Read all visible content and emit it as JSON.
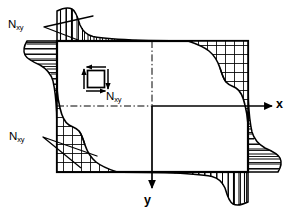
{
  "figure": {
    "type": "engineering-diagram",
    "background_color": "#ffffff",
    "line_color": "#000000",
    "width": 291,
    "height": 215
  },
  "labels": {
    "shear_symbol": "N",
    "shear_subscript": "xy",
    "axis_x": "x",
    "axis_y": "y",
    "callout_top_left": {
      "symbol": "N",
      "subscript": "xy"
    },
    "callout_bottom_left": {
      "symbol": "N",
      "subscript": "xy"
    },
    "callout_center": {
      "symbol": "N",
      "subscript": "xy"
    }
  },
  "plate": {
    "left": 57,
    "top": 41,
    "right": 248,
    "bottom": 172,
    "stroke_width": 2.2,
    "fill": "#ffffff"
  },
  "axes": {
    "origin_x": 152,
    "origin_y": 106,
    "x_axis": {
      "from_x": 57,
      "to_x": 272,
      "y": 106,
      "arrow": "right",
      "label": "x"
    },
    "y_axis": {
      "x": 152,
      "from_y": 41,
      "to_y": 188,
      "arrow": "down",
      "label": "y"
    },
    "centerline_style": "dash-dot"
  },
  "shear_element": {
    "center_x": 96,
    "center_y": 79,
    "size": 17,
    "arrows": [
      {
        "edge": "top",
        "direction": "left"
      },
      {
        "edge": "bottom",
        "direction": "right"
      },
      {
        "edge": "left",
        "direction": "up"
      },
      {
        "edge": "right",
        "direction": "down"
      }
    ]
  },
  "distributions": [
    {
      "name": "top-edge-external",
      "edge": "top",
      "side": "outside",
      "hatch": "vertical",
      "peak_at": "left",
      "decay": "toward-right"
    },
    {
      "name": "left-edge-external",
      "edge": "left",
      "side": "outside",
      "hatch": "horizontal",
      "peak_at": "top",
      "decay": "toward-bottom"
    },
    {
      "name": "bottom-edge-external",
      "edge": "bottom",
      "side": "outside",
      "hatch": "vertical",
      "peak_at": "right",
      "decay": "toward-left"
    },
    {
      "name": "right-edge-external",
      "edge": "right",
      "side": "outside",
      "hatch": "horizontal",
      "peak_at": "bottom",
      "decay": "toward-top"
    },
    {
      "name": "top-right-internal",
      "corner": "top-right",
      "side": "inside",
      "hatch": "cross",
      "shape": "concave-curve"
    },
    {
      "name": "bottom-left-internal",
      "corner": "bottom-left",
      "side": "inside",
      "hatch": "cross",
      "shape": "concave-curve"
    }
  ],
  "leader_lines": [
    {
      "name": "leader-top-left",
      "from": [
        47,
        27
      ],
      "to": [
        [
          92,
          16
        ],
        [
          77,
          40
        ]
      ]
    },
    {
      "name": "leader-bottom-left",
      "from": [
        46,
        138
      ],
      "to": [
        [
          96,
          156
        ],
        [
          80,
          168
        ]
      ]
    }
  ]
}
